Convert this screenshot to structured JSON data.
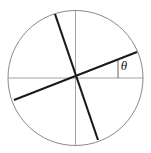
{
  "figure": {
    "background_color": "#ffffff",
    "width": 151,
    "height": 153
  },
  "labels": {
    "theta": "θ"
  },
  "chart_data": {
    "type": "diagram",
    "title": "",
    "subtitle": "",
    "xlabel": "",
    "ylabel": "",
    "grid": false,
    "legend": null,
    "annotations": [
      {
        "name": "theta",
        "text": "θ",
        "x": 124,
        "y": 67,
        "style": "italic-serif"
      }
    ],
    "shapes": [
      {
        "name": "circle-outline",
        "type": "circle",
        "cx": 75.5,
        "cy": 78,
        "r": 67.5,
        "stroke": "#7a7a7a",
        "stroke_width": 0.9,
        "fill": "none"
      },
      {
        "name": "horizontal-axis",
        "type": "line",
        "x1": 8,
        "y1": 78,
        "x2": 143,
        "y2": 78,
        "stroke": "#8c8c8c",
        "stroke_width": 0.8
      },
      {
        "name": "vertical-axis",
        "type": "line",
        "x1": 75.5,
        "y1": 10.5,
        "x2": 75.5,
        "y2": 145.5,
        "stroke": "#8c8c8c",
        "stroke_width": 0.8
      },
      {
        "name": "steep-chord",
        "type": "line",
        "x1": 55,
        "y1": 14,
        "x2": 98,
        "y2": 140,
        "stroke": "#1a1a1a",
        "stroke_width": 2.1
      },
      {
        "name": "shallow-chord",
        "type": "line",
        "x1": 14,
        "y1": 100,
        "x2": 137,
        "y2": 52,
        "stroke": "#1a1a1a",
        "stroke_width": 2.1
      },
      {
        "name": "angle-tick",
        "type": "line",
        "x1": 118,
        "y1": 78,
        "x2": 118,
        "y2": 59.5,
        "stroke": "#3a3a3a",
        "stroke_width": 0.8
      }
    ]
  }
}
